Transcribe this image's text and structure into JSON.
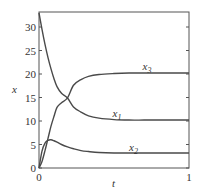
{
  "chart_data": {
    "type": "line",
    "title": "",
    "xlabel": "t",
    "ylabel": "x",
    "xlim": [
      0,
      1
    ],
    "ylim": [
      0,
      33.2
    ],
    "grid": false,
    "legend": "inline labels",
    "x_ticks": [
      "0",
      "1"
    ],
    "y_ticks": [
      "0",
      "5",
      "10",
      "15",
      "20",
      "25",
      "30"
    ],
    "x": [
      0,
      0.02,
      0.04,
      0.06,
      0.08,
      0.1,
      0.12,
      0.15,
      0.19,
      0.23,
      0.28,
      0.33,
      0.4,
      0.5,
      0.6,
      0.7,
      0.8,
      0.9,
      1.0
    ],
    "series": [
      {
        "name": "x1",
        "label_main": "x",
        "label_sub": "1",
        "values": [
          33,
          29.5,
          26.3,
          23.5,
          21.1,
          19.0,
          17.3,
          15.9,
          14.9,
          13.0,
          11.9,
          11.1,
          10.6,
          10.3,
          10.2,
          10.2,
          10.2,
          10.2,
          10.2
        ]
      },
      {
        "name": "x2",
        "label_main": "x",
        "label_sub": "2",
        "values": [
          0,
          3.6,
          5.3,
          5.9,
          6.0,
          5.8,
          5.5,
          5.0,
          4.5,
          4.1,
          3.7,
          3.5,
          3.3,
          3.2,
          3.2,
          3.2,
          3.2,
          3.2,
          3.2
        ]
      },
      {
        "name": "x3",
        "label_main": "x",
        "label_sub": "3",
        "values": [
          0,
          1.4,
          3.7,
          6.3,
          8.9,
          11.0,
          12.9,
          13.9,
          14.9,
          17.6,
          18.8,
          19.5,
          19.9,
          20.1,
          20.2,
          20.2,
          20.2,
          20.2,
          20.2
        ]
      }
    ],
    "label_positions": {
      "x1": [
        0.49,
        10.9
      ],
      "x2": [
        0.6,
        3.7
      ],
      "x3": [
        0.69,
        20.8
      ]
    },
    "colors": {
      "line": "#4a4a4a",
      "axis": "#555555"
    }
  }
}
